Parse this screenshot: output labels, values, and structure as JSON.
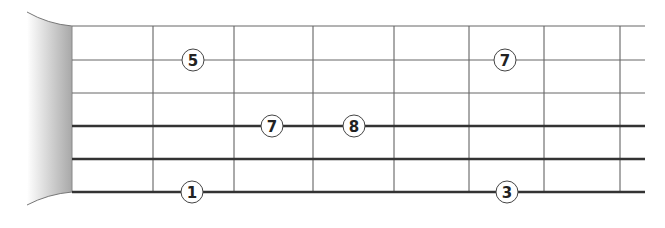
{
  "diagram": {
    "type": "guitar-fretboard",
    "strings": [
      {
        "index": 1,
        "y": 26,
        "thickness": 1
      },
      {
        "index": 2,
        "y": 60,
        "thickness": 1
      },
      {
        "index": 3,
        "y": 93,
        "thickness": 1
      },
      {
        "index": 4,
        "y": 126,
        "thickness": 2.5
      },
      {
        "index": 5,
        "y": 159,
        "thickness": 2.5
      },
      {
        "index": 6,
        "y": 192,
        "thickness": 2.5
      }
    ],
    "frets_x": [
      153,
      234,
      313,
      394,
      469,
      544,
      620
    ],
    "nut_x": 72,
    "notes": [
      {
        "label": "5",
        "string": 2,
        "x": 193,
        "y": 60
      },
      {
        "label": "7",
        "string": 2,
        "x": 505,
        "y": 60
      },
      {
        "label": "7",
        "string": 4,
        "x": 272,
        "y": 126
      },
      {
        "label": "8",
        "string": 4,
        "x": 354,
        "y": 126
      },
      {
        "label": "1",
        "string": 6,
        "x": 192,
        "y": 192
      },
      {
        "label": "3",
        "string": 6,
        "x": 507,
        "y": 192
      }
    ]
  }
}
